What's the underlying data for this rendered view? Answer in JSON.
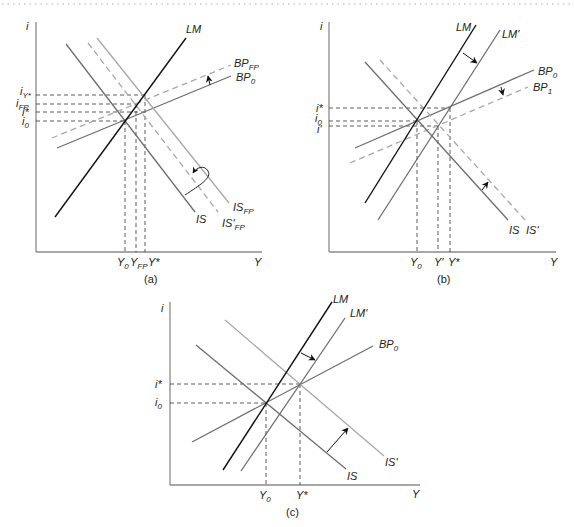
{
  "colors": {
    "axis": "#8a8a8a",
    "lm": "#111111",
    "is": "#6e6e6e",
    "shifted": "#a8a8a8",
    "guide": "#333333",
    "arrow": "#111111",
    "border_dots": "#b0b0b0"
  },
  "panels": [
    {
      "id": "a",
      "caption": "(a)",
      "axis_labels": {
        "y": "i",
        "x": "Y"
      },
      "curves": [
        {
          "name": "LM",
          "label": "LM",
          "style": "black"
        },
        {
          "name": "IS",
          "label": "IS",
          "style": "solid-gray"
        },
        {
          "name": "IS_FP",
          "label": "IS",
          "sub": "FP",
          "style": "solid-light"
        },
        {
          "name": "IS'_FP",
          "label": "IS'",
          "sub": "FP",
          "style": "dashed-light"
        },
        {
          "name": "BP_0",
          "label": "BP",
          "sub": "0",
          "style": "solid-gray"
        },
        {
          "name": "BP_FP",
          "label": "BP",
          "sub": "FP",
          "style": "dashed-light"
        }
      ],
      "y_ticks": [
        {
          "label": "i",
          "sub": "Y*"
        },
        {
          "label": "i",
          "sub": "FP"
        },
        {
          "label": "i*",
          "sub": ""
        },
        {
          "label": "i",
          "sub": "0"
        }
      ],
      "x_ticks": [
        {
          "label": "Y",
          "sub": "0"
        },
        {
          "label": "Y",
          "sub": "FP"
        },
        {
          "label": "Y*",
          "sub": ""
        }
      ]
    },
    {
      "id": "b",
      "caption": "(b)",
      "axis_labels": {
        "y": "i",
        "x": "Y"
      },
      "curves": [
        {
          "name": "LM",
          "label": "LM",
          "style": "black"
        },
        {
          "name": "LM'",
          "label": "LM'",
          "style": "solid-gray"
        },
        {
          "name": "IS",
          "label": "IS",
          "style": "solid-gray"
        },
        {
          "name": "IS'",
          "label": "IS'",
          "style": "dashed-light"
        },
        {
          "name": "BP_0",
          "label": "BP",
          "sub": "0",
          "style": "solid-gray"
        },
        {
          "name": "BP_1",
          "label": "BP",
          "sub": "1",
          "style": "dashed-light"
        }
      ],
      "y_ticks": [
        {
          "label": "i*",
          "sub": ""
        },
        {
          "label": "i",
          "sub": "0"
        },
        {
          "label": "i'",
          "sub": ""
        }
      ],
      "x_ticks": [
        {
          "label": "Y",
          "sub": "0"
        },
        {
          "label": "Y'",
          "sub": ""
        },
        {
          "label": "Y*",
          "sub": ""
        }
      ]
    },
    {
      "id": "c",
      "caption": "(c)",
      "axis_labels": {
        "y": "i",
        "x": "Y"
      },
      "curves": [
        {
          "name": "LM",
          "label": "LM",
          "style": "black"
        },
        {
          "name": "LM'",
          "label": "LM'",
          "style": "solid-gray"
        },
        {
          "name": "IS",
          "label": "IS",
          "style": "solid-gray"
        },
        {
          "name": "IS'",
          "label": "IS'",
          "style": "solid-light"
        },
        {
          "name": "BP_0",
          "label": "BP",
          "sub": "0",
          "style": "solid-gray"
        }
      ],
      "y_ticks": [
        {
          "label": "i*",
          "sub": ""
        },
        {
          "label": "i",
          "sub": "0"
        }
      ],
      "x_ticks": [
        {
          "label": "Y",
          "sub": "0"
        },
        {
          "label": "Y*",
          "sub": ""
        }
      ]
    }
  ]
}
